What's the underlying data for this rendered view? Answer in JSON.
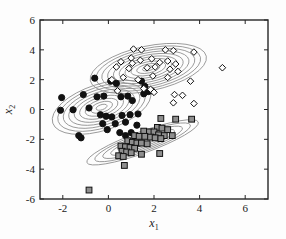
{
  "chart_data": {
    "type": "scatter",
    "title": "",
    "xlabel": "x_1",
    "ylabel": "x_2",
    "xlim": [
      -3,
      7
    ],
    "ylim": [
      -6,
      6
    ],
    "xticks": [
      -2,
      0,
      2,
      4,
      6
    ],
    "yticks": [
      -6,
      -4,
      -2,
      0,
      2,
      4,
      6
    ],
    "xtick_labels": [
      "-2",
      "0",
      "2",
      "4",
      "6"
    ],
    "ytick_labels": [
      "-6",
      "-4",
      "-2",
      "0",
      "2",
      "4",
      "6"
    ],
    "grid": false,
    "legend": "none",
    "contour_color": "#8c8c8c",
    "axes_color": "#262626",
    "background": "#fdfdfd",
    "series": [
      {
        "name": "cluster-circles",
        "marker": "filled-circle",
        "color": "#111111",
        "edge_color": "#111111",
        "points": [
          [
            -0.6,
            2.1
          ],
          [
            0.1,
            1.9
          ],
          [
            0.35,
            1.75
          ],
          [
            1.45,
            1.9
          ],
          [
            1.6,
            1.55
          ],
          [
            1.75,
            1.2
          ],
          [
            1.9,
            1.25
          ],
          [
            1.55,
            1.05
          ],
          [
            -2.05,
            0.8
          ],
          [
            -1.1,
            1.0
          ],
          [
            -0.5,
            0.85
          ],
          [
            -0.2,
            0.9
          ],
          [
            0.55,
            0.85
          ],
          [
            0.85,
            0.9
          ],
          [
            1.05,
            0.6
          ],
          [
            -2.1,
            -0.05
          ],
          [
            -1.55,
            -0.02
          ],
          [
            -0.85,
            0.1
          ],
          [
            -0.35,
            -0.35
          ],
          [
            -0.1,
            -0.45
          ],
          [
            0.15,
            -0.5
          ],
          [
            0.6,
            -0.4
          ],
          [
            0.95,
            -0.35
          ],
          [
            1.3,
            -0.3
          ],
          [
            -0.25,
            -0.95
          ],
          [
            0.3,
            -0.95
          ],
          [
            0.75,
            -0.85
          ],
          [
            -1.3,
            -1.75
          ],
          [
            -1.2,
            -1.9
          ],
          [
            -0.05,
            -1.35
          ],
          [
            0.5,
            -1.55
          ],
          [
            0.75,
            -1.75
          ],
          [
            1.0,
            -1.55
          ],
          [
            1.25,
            -1.05
          ]
        ],
        "contour_center": [
          -0.3,
          0.15
        ],
        "contour_rx": 2.25,
        "contour_ry": 1.55,
        "contour_rotation": -18,
        "contour_levels": 9
      },
      {
        "name": "cluster-diamonds",
        "marker": "hollow-diamond",
        "color": "#ffffff",
        "edge_color": "#111111",
        "points": [
          [
            1.1,
            4.05
          ],
          [
            1.45,
            4.0
          ],
          [
            2.5,
            4.0
          ],
          [
            2.85,
            3.95
          ],
          [
            3.75,
            3.85
          ],
          [
            0.55,
            3.2
          ],
          [
            1.0,
            3.45
          ],
          [
            1.05,
            3.1
          ],
          [
            1.4,
            3.3
          ],
          [
            1.9,
            3.4
          ],
          [
            2.25,
            3.15
          ],
          [
            2.6,
            3.25
          ],
          [
            2.95,
            3.05
          ],
          [
            0.35,
            2.85
          ],
          [
            0.9,
            2.75
          ],
          [
            1.7,
            2.8
          ],
          [
            2.05,
            2.85
          ],
          [
            2.7,
            2.7
          ],
          [
            3.05,
            2.55
          ],
          [
            5.0,
            2.8
          ],
          [
            0.15,
            2.0
          ],
          [
            0.65,
            2.15
          ],
          [
            1.3,
            2.0
          ],
          [
            1.95,
            2.25
          ],
          [
            2.6,
            2.15
          ],
          [
            3.6,
            1.9
          ],
          [
            0.4,
            1.25
          ],
          [
            1.55,
            1.4
          ],
          [
            1.85,
            1.35
          ],
          [
            2.0,
            1.15
          ],
          [
            2.9,
            1.0
          ],
          [
            3.25,
            0.95
          ],
          [
            2.85,
            0.45
          ],
          [
            3.75,
            0.4
          ]
        ],
        "contour_center": [
          1.75,
          2.75
        ],
        "contour_rx": 2.6,
        "contour_ry": 1.5,
        "contour_rotation": -12,
        "contour_levels": 10
      },
      {
        "name": "cluster-squares",
        "marker": "filled-square",
        "color": "#8e8e8e",
        "edge_color": "#111111",
        "points": [
          [
            2.3,
            -0.6
          ],
          [
            2.95,
            -0.65
          ],
          [
            3.65,
            -0.65
          ],
          [
            2.15,
            -1.2
          ],
          [
            2.35,
            -1.25
          ],
          [
            2.6,
            -1.35
          ],
          [
            1.55,
            -1.45
          ],
          [
            1.8,
            -1.5
          ],
          [
            2.0,
            -1.5
          ],
          [
            2.2,
            -1.7
          ],
          [
            2.45,
            -1.75
          ],
          [
            2.8,
            -1.75
          ],
          [
            1.15,
            -1.75
          ],
          [
            1.35,
            -1.8
          ],
          [
            1.6,
            -1.8
          ],
          [
            1.85,
            -1.85
          ],
          [
            2.05,
            -1.9
          ],
          [
            2.3,
            -1.95
          ],
          [
            0.85,
            -2.1
          ],
          [
            1.05,
            -2.2
          ],
          [
            1.25,
            -2.25
          ],
          [
            1.45,
            -2.25
          ],
          [
            1.7,
            -2.3
          ],
          [
            0.55,
            -2.45
          ],
          [
            0.75,
            -2.5
          ],
          [
            0.95,
            -2.55
          ],
          [
            1.15,
            -2.6
          ],
          [
            0.6,
            -2.8
          ],
          [
            0.8,
            -2.85
          ],
          [
            1.0,
            -2.9
          ],
          [
            2.25,
            -2.95
          ],
          [
            0.45,
            -3.1
          ],
          [
            0.65,
            -3.15
          ],
          [
            1.45,
            -3.0
          ],
          [
            0.7,
            -3.75
          ],
          [
            -0.85,
            -5.4
          ]
        ],
        "contour_center": [
          1.5,
          -2.2
        ],
        "contour_rx": 2.6,
        "contour_ry": 0.72,
        "contour_rotation": -20,
        "contour_levels": 7
      }
    ]
  }
}
